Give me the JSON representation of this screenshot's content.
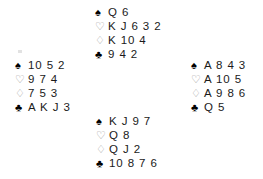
{
  "diagram": {
    "type": "bridge-deal",
    "background_color": "#ffffff",
    "suit_symbols": {
      "spades": "♠",
      "hearts": "♡",
      "diamonds": "♢",
      "clubs": "♣"
    },
    "suit_colors": {
      "spades": "#000000",
      "hearts": "#9a9a9a",
      "diamonds": "#9a9a9a",
      "clubs": "#000000"
    },
    "hands": {
      "north": {
        "position_label": "North",
        "suits": [
          {
            "suit": "spades",
            "symbol": "♠",
            "cards": "Q 6"
          },
          {
            "suit": "hearts",
            "symbol": "♡",
            "cards": "K J 6 3 2"
          },
          {
            "suit": "diamonds",
            "symbol": "♢",
            "cards": "K 10 4"
          },
          {
            "suit": "clubs",
            "symbol": "♣",
            "cards": "9 4 2"
          }
        ]
      },
      "west": {
        "position_label": "West",
        "suits": [
          {
            "suit": "spades",
            "symbol": "♠",
            "cards": "10 5 2"
          },
          {
            "suit": "hearts",
            "symbol": "♡",
            "cards": "9 7 4"
          },
          {
            "suit": "diamonds",
            "symbol": "♢",
            "cards": "7 5 3"
          },
          {
            "suit": "clubs",
            "symbol": "♣",
            "cards": "A K J 3"
          }
        ]
      },
      "east": {
        "position_label": "East",
        "suits": [
          {
            "suit": "spades",
            "symbol": "♠",
            "cards": "A 8 4 3"
          },
          {
            "suit": "hearts",
            "symbol": "♡",
            "cards": "A 10 5"
          },
          {
            "suit": "diamonds",
            "symbol": "♢",
            "cards": "A 9 8 6"
          },
          {
            "suit": "clubs",
            "symbol": "♣",
            "cards": "Q 5"
          }
        ]
      },
      "south": {
        "position_label": "South",
        "suits": [
          {
            "suit": "spades",
            "symbol": "♠",
            "cards": "K J 9 7"
          },
          {
            "suit": "hearts",
            "symbol": "♡",
            "cards": "Q 8"
          },
          {
            "suit": "diamonds",
            "symbol": "♢",
            "cards": "Q J 2"
          },
          {
            "suit": "clubs",
            "symbol": "♣",
            "cards": "10 8 7 6"
          }
        ]
      }
    }
  }
}
